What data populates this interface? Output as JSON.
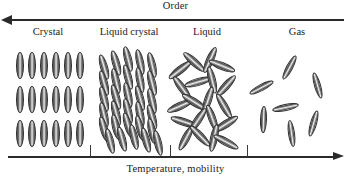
{
  "figure": {
    "top_axis": {
      "label": "Order",
      "direction": "left",
      "arrow_icon": "arrow-left-icon"
    },
    "bottom_axis": {
      "label": "Temperature, mobility",
      "direction": "right",
      "arrow_icon": "arrow-right-icon",
      "tick_positions_px": [
        90,
        170,
        247
      ]
    },
    "phases": [
      {
        "label": "Crystal",
        "center_x": 48,
        "order_rank": 4
      },
      {
        "label": "Liquid crystal",
        "center_x": 129,
        "order_rank": 3
      },
      {
        "label": "Liquid",
        "center_x": 207,
        "order_rank": 2
      },
      {
        "label": "Gas",
        "center_x": 297,
        "order_rank": 1
      }
    ],
    "colors": {
      "axis": "#2a2a2a",
      "text": "#1b1b1b",
      "molecule_outline": "#2e2e2e",
      "molecule_highlight": "#f2f2f2",
      "background": "#ffffff"
    }
  },
  "chart_data": {
    "type": "diagram",
    "title": "Order",
    "xlabel": "Temperature, mobility",
    "categories": [
      "Crystal",
      "Liquid crystal",
      "Liquid",
      "Gas"
    ],
    "molecule_counts": [
      18,
      30,
      20,
      7
    ],
    "order_ranking": [
      4,
      3,
      2,
      1
    ],
    "molecules": {
      "crystal": [
        {
          "x": 4,
          "y": 8,
          "w": 8,
          "h": 27,
          "a": 0
        },
        {
          "x": 16,
          "y": 8,
          "w": 8,
          "h": 27,
          "a": 0
        },
        {
          "x": 28,
          "y": 8,
          "w": 8,
          "h": 27,
          "a": 0
        },
        {
          "x": 40,
          "y": 8,
          "w": 8,
          "h": 27,
          "a": 0
        },
        {
          "x": 52,
          "y": 8,
          "w": 8,
          "h": 27,
          "a": 0
        },
        {
          "x": 64,
          "y": 8,
          "w": 8,
          "h": 27,
          "a": 0
        },
        {
          "x": 4,
          "y": 42,
          "w": 8,
          "h": 27,
          "a": 0
        },
        {
          "x": 16,
          "y": 42,
          "w": 8,
          "h": 27,
          "a": 0
        },
        {
          "x": 28,
          "y": 42,
          "w": 8,
          "h": 27,
          "a": 0
        },
        {
          "x": 40,
          "y": 42,
          "w": 8,
          "h": 27,
          "a": 0
        },
        {
          "x": 52,
          "y": 42,
          "w": 8,
          "h": 27,
          "a": 0
        },
        {
          "x": 64,
          "y": 42,
          "w": 8,
          "h": 27,
          "a": 0
        },
        {
          "x": 4,
          "y": 76,
          "w": 8,
          "h": 27,
          "a": 0
        },
        {
          "x": 16,
          "y": 76,
          "w": 8,
          "h": 27,
          "a": 0
        },
        {
          "x": 28,
          "y": 76,
          "w": 8,
          "h": 27,
          "a": 0
        },
        {
          "x": 40,
          "y": 76,
          "w": 8,
          "h": 27,
          "a": 0
        },
        {
          "x": 52,
          "y": 76,
          "w": 8,
          "h": 27,
          "a": 0
        },
        {
          "x": 64,
          "y": 76,
          "w": 8,
          "h": 27,
          "a": 0
        }
      ],
      "liquid_crystal": [
        {
          "x": 2,
          "y": 10,
          "w": 8,
          "h": 26,
          "a": -16
        },
        {
          "x": 14,
          "y": 6,
          "w": 8,
          "h": 26,
          "a": -16
        },
        {
          "x": 26,
          "y": 2,
          "w": 8,
          "h": 26,
          "a": -14
        },
        {
          "x": 38,
          "y": 5,
          "w": 8,
          "h": 26,
          "a": -12
        },
        {
          "x": 50,
          "y": 8,
          "w": 8,
          "h": 26,
          "a": -13
        },
        {
          "x": 2,
          "y": 26,
          "w": 8,
          "h": 26,
          "a": -15
        },
        {
          "x": 14,
          "y": 24,
          "w": 8,
          "h": 26,
          "a": -13
        },
        {
          "x": 26,
          "y": 20,
          "w": 8,
          "h": 26,
          "a": -15
        },
        {
          "x": 38,
          "y": 23,
          "w": 8,
          "h": 26,
          "a": -11
        },
        {
          "x": 50,
          "y": 26,
          "w": 8,
          "h": 26,
          "a": -14
        },
        {
          "x": 2,
          "y": 42,
          "w": 8,
          "h": 26,
          "a": -14
        },
        {
          "x": 14,
          "y": 40,
          "w": 8,
          "h": 26,
          "a": -16
        },
        {
          "x": 26,
          "y": 38,
          "w": 8,
          "h": 26,
          "a": -12
        },
        {
          "x": 38,
          "y": 41,
          "w": 8,
          "h": 26,
          "a": -15
        },
        {
          "x": 50,
          "y": 44,
          "w": 8,
          "h": 26,
          "a": -13
        },
        {
          "x": 2,
          "y": 58,
          "w": 8,
          "h": 26,
          "a": -13
        },
        {
          "x": 14,
          "y": 56,
          "w": 8,
          "h": 26,
          "a": -15
        },
        {
          "x": 26,
          "y": 54,
          "w": 8,
          "h": 26,
          "a": -14
        },
        {
          "x": 38,
          "y": 57,
          "w": 8,
          "h": 26,
          "a": -12
        },
        {
          "x": 50,
          "y": 60,
          "w": 8,
          "h": 26,
          "a": -16
        },
        {
          "x": 2,
          "y": 72,
          "w": 8,
          "h": 26,
          "a": -15
        },
        {
          "x": 14,
          "y": 70,
          "w": 8,
          "h": 26,
          "a": -13
        },
        {
          "x": 26,
          "y": 68,
          "w": 8,
          "h": 26,
          "a": -16
        },
        {
          "x": 38,
          "y": 71,
          "w": 8,
          "h": 26,
          "a": -14
        },
        {
          "x": 50,
          "y": 74,
          "w": 8,
          "h": 26,
          "a": -12
        },
        {
          "x": 8,
          "y": 84,
          "w": 8,
          "h": 26,
          "a": -14
        },
        {
          "x": 20,
          "y": 82,
          "w": 8,
          "h": 26,
          "a": -15
        },
        {
          "x": 32,
          "y": 80,
          "w": 8,
          "h": 26,
          "a": -13
        },
        {
          "x": 44,
          "y": 83,
          "w": 8,
          "h": 26,
          "a": -15
        },
        {
          "x": 56,
          "y": 86,
          "w": 8,
          "h": 26,
          "a": -13
        }
      ],
      "liquid": [
        {
          "x": 0,
          "y": 12,
          "w": 8,
          "h": 28,
          "a": 52
        },
        {
          "x": 14,
          "y": 4,
          "w": 8,
          "h": 28,
          "a": -48
        },
        {
          "x": 30,
          "y": 2,
          "w": 8,
          "h": 28,
          "a": 24
        },
        {
          "x": 42,
          "y": 8,
          "w": 8,
          "h": 28,
          "a": -68
        },
        {
          "x": 2,
          "y": 30,
          "w": 8,
          "h": 28,
          "a": -36
        },
        {
          "x": 18,
          "y": 24,
          "w": 8,
          "h": 28,
          "a": 74
        },
        {
          "x": 32,
          "y": 22,
          "w": 8,
          "h": 28,
          "a": -14
        },
        {
          "x": 46,
          "y": 28,
          "w": 8,
          "h": 28,
          "a": 42
        },
        {
          "x": 0,
          "y": 48,
          "w": 8,
          "h": 28,
          "a": 66
        },
        {
          "x": 14,
          "y": 44,
          "w": 8,
          "h": 28,
          "a": -58
        },
        {
          "x": 28,
          "y": 42,
          "w": 8,
          "h": 28,
          "a": 18
        },
        {
          "x": 44,
          "y": 48,
          "w": 8,
          "h": 28,
          "a": -30
        },
        {
          "x": 4,
          "y": 64,
          "w": 8,
          "h": 28,
          "a": -72
        },
        {
          "x": 18,
          "y": 62,
          "w": 8,
          "h": 28,
          "a": 34
        },
        {
          "x": 32,
          "y": 60,
          "w": 8,
          "h": 28,
          "a": -20
        },
        {
          "x": 46,
          "y": 66,
          "w": 8,
          "h": 28,
          "a": 58
        },
        {
          "x": 6,
          "y": 80,
          "w": 8,
          "h": 28,
          "a": 28
        },
        {
          "x": 20,
          "y": 78,
          "w": 8,
          "h": 28,
          "a": -44
        },
        {
          "x": 34,
          "y": 80,
          "w": 8,
          "h": 28,
          "a": 12
        },
        {
          "x": 46,
          "y": 84,
          "w": 8,
          "h": 28,
          "a": -62
        }
      ],
      "gas": [
        {
          "x": 0,
          "y": 30,
          "w": 7,
          "h": 27,
          "a": 62
        },
        {
          "x": 28,
          "y": 10,
          "w": 7,
          "h": 27,
          "a": 28
        },
        {
          "x": 56,
          "y": 28,
          "w": 7,
          "h": 27,
          "a": -16
        },
        {
          "x": 2,
          "y": 62,
          "w": 7,
          "h": 27,
          "a": 2
        },
        {
          "x": 24,
          "y": 50,
          "w": 7,
          "h": 27,
          "a": 78
        },
        {
          "x": 30,
          "y": 76,
          "w": 7,
          "h": 27,
          "a": -8
        },
        {
          "x": 52,
          "y": 66,
          "w": 7,
          "h": 27,
          "a": 16
        }
      ]
    }
  }
}
